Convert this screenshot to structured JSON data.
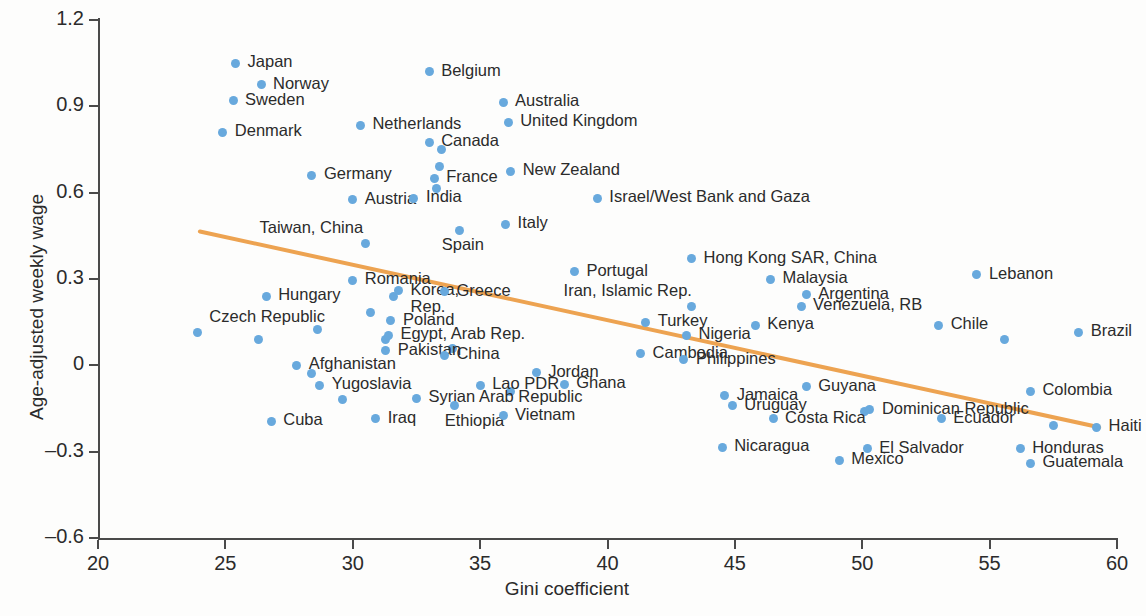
{
  "chart_data": {
    "type": "scatter",
    "title": "",
    "xlabel": "Gini coefficient",
    "ylabel": "Age-adjusted weekly wage",
    "xlim": [
      20,
      60
    ],
    "ylim": [
      -0.6,
      1.2
    ],
    "xticks": [
      "20",
      "25",
      "30",
      "35",
      "40",
      "45",
      "50",
      "55",
      "60"
    ],
    "yticks": [
      "1.2",
      "0.9",
      "0.6",
      "0.3",
      "0",
      "–0.3",
      "–0.6"
    ],
    "grid": false,
    "legend": "none",
    "marker_color": "#68a9dd",
    "trendline_color": "#eda351",
    "trendline": {
      "x1": 24.0,
      "y1": 0.465,
      "x2": 59.3,
      "y2": -0.215
    },
    "points": [
      {
        "label": "Japan",
        "x": 25.4,
        "y": 1.05,
        "lx": 12,
        "ly": -10
      },
      {
        "label": "Norway",
        "x": 26.4,
        "y": 0.975,
        "lx": 12,
        "ly": -10
      },
      {
        "label": "Sweden",
        "x": 25.3,
        "y": 0.92,
        "lx": 12,
        "ly": -10
      },
      {
        "label": "Denmark",
        "x": 24.9,
        "y": 0.81,
        "lx": 12,
        "ly": -10
      },
      {
        "label": "Belgium",
        "x": 33.0,
        "y": 1.02,
        "lx": 12,
        "ly": -10
      },
      {
        "label": "Australia",
        "x": 35.9,
        "y": 0.915,
        "lx": 12,
        "ly": -10
      },
      {
        "label": "United Kingdom",
        "x": 36.1,
        "y": 0.845,
        "lx": 12,
        "ly": -10
      },
      {
        "label": "Netherlands",
        "x": 30.3,
        "y": 0.835,
        "lx": 12,
        "ly": -10
      },
      {
        "label": "Canada",
        "x": 33.0,
        "y": 0.775,
        "lx": 12,
        "ly": -10
      },
      {
        "label": "Germany",
        "x": 28.4,
        "y": 0.66,
        "lx": 12,
        "ly": -10
      },
      {
        "label": "France",
        "x": 33.2,
        "y": 0.65,
        "lx": 12,
        "ly": -10
      },
      {
        "label": "New Zealand",
        "x": 36.2,
        "y": 0.675,
        "lx": 12,
        "ly": -10
      },
      {
        "label": "Austria",
        "x": 30.0,
        "y": 0.575,
        "lx": 12,
        "ly": -10
      },
      {
        "label": "India",
        "x": 32.4,
        "y": 0.58,
        "lx": 12,
        "ly": -10
      },
      {
        "label": "Israel/West Bank and Gaza",
        "x": 39.6,
        "y": 0.58,
        "lx": 12,
        "ly": -10
      },
      {
        "label": "Italy",
        "x": 36.0,
        "y": 0.49,
        "lx": 12,
        "ly": -10
      },
      {
        "label": "Taiwan, China",
        "x": 30.5,
        "y": 0.425,
        "lx": -100,
        "ly": -24
      },
      {
        "label": "Spain",
        "x": 34.2,
        "y": 0.47,
        "lx": -18,
        "ly": 6
      },
      {
        "label": "Hong Kong SAR, China",
        "x": 43.3,
        "y": 0.37,
        "lx": 12,
        "ly": -10
      },
      {
        "label": "Portugal",
        "x": 38.7,
        "y": 0.325,
        "lx": 12,
        "ly": -10
      },
      {
        "label": "Malaysia",
        "x": 46.4,
        "y": 0.3,
        "lx": 12,
        "ly": -10
      },
      {
        "label": "Lebanon",
        "x": 54.5,
        "y": 0.315,
        "lx": 12,
        "ly": -10
      },
      {
        "label": "Romania",
        "x": 30.0,
        "y": 0.295,
        "lx": 12,
        "ly": -10
      },
      {
        "label": "Hungary",
        "x": 26.6,
        "y": 0.24,
        "lx": 12,
        "ly": -10
      },
      {
        "label": "Korea, Rep.",
        "x": 31.8,
        "y": 0.26,
        "lx": 12,
        "ly": -10
      },
      {
        "label": "Greece",
        "x": 33.6,
        "y": 0.255,
        "lx": 12,
        "ly": -10
      },
      {
        "label": "Iran, Islamic Rep.",
        "x": 43.3,
        "y": 0.205,
        "lx": -130,
        "ly": -24
      },
      {
        "label": "Argentina",
        "x": 47.8,
        "y": 0.245,
        "lx": 12,
        "ly": -10
      },
      {
        "label": "Venezuela, RB",
        "x": 47.6,
        "y": 0.205,
        "lx": 12,
        "ly": -10
      },
      {
        "label": "Czech Republic",
        "x": 23.9,
        "y": 0.115,
        "lx": 12,
        "ly": -24
      },
      {
        "label": "Poland",
        "x": 31.5,
        "y": 0.155,
        "lx": 12,
        "ly": -10
      },
      {
        "label": "Turkey",
        "x": 41.5,
        "y": 0.15,
        "lx": 12,
        "ly": -10
      },
      {
        "label": "Kenya",
        "x": 45.8,
        "y": 0.14,
        "lx": 12,
        "ly": -10
      },
      {
        "label": "Chile",
        "x": 53.0,
        "y": 0.14,
        "lx": 12,
        "ly": -10
      },
      {
        "label": "Brazil",
        "x": 58.5,
        "y": 0.115,
        "lx": 12,
        "ly": -10
      },
      {
        "label": "Egypt, Arab Rep.",
        "x": 31.4,
        "y": 0.105,
        "lx": 12,
        "ly": -10
      },
      {
        "label": "Nigeria",
        "x": 43.1,
        "y": 0.105,
        "lx": 12,
        "ly": -10
      },
      {
        "label": "Cambodia",
        "x": 41.3,
        "y": 0.04,
        "lx": 12,
        "ly": -10
      },
      {
        "label": "Pakistan",
        "x": 31.3,
        "y": 0.05,
        "lx": 12,
        "ly": -10
      },
      {
        "label": "China",
        "x": 33.6,
        "y": 0.035,
        "lx": 12,
        "ly": -10
      },
      {
        "label": "Philippines",
        "x": 43.0,
        "y": 0.02,
        "lx": 12,
        "ly": -10
      },
      {
        "label": "Afghanistan",
        "x": 27.8,
        "y": 0.0,
        "lx": 12,
        "ly": -10
      },
      {
        "label": "Jordan",
        "x": 37.2,
        "y": -0.025,
        "lx": 12,
        "ly": -10
      },
      {
        "label": "Ghana",
        "x": 38.3,
        "y": -0.065,
        "lx": 12,
        "ly": -10
      },
      {
        "label": "Guyana",
        "x": 47.8,
        "y": -0.075,
        "lx": 12,
        "ly": -10
      },
      {
        "label": "Yugoslavia",
        "x": 28.7,
        "y": -0.07,
        "lx": 12,
        "ly": -10
      },
      {
        "label": "Lao PDR",
        "x": 35.0,
        "y": -0.07,
        "lx": 12,
        "ly": -10
      },
      {
        "label": "Colombia",
        "x": 56.6,
        "y": -0.09,
        "lx": 12,
        "ly": -10
      },
      {
        "label": "Syrian Arab Republic",
        "x": 32.5,
        "y": -0.115,
        "lx": 12,
        "ly": -10
      },
      {
        "label": "Jamaica",
        "x": 44.6,
        "y": -0.105,
        "lx": 12,
        "ly": -10
      },
      {
        "label": "Uruguay",
        "x": 44.9,
        "y": -0.14,
        "lx": 12,
        "ly": -10
      },
      {
        "label": "Dominican Republic",
        "x": 50.3,
        "y": -0.155,
        "lx": 12,
        "ly": -10
      },
      {
        "label": "Ethiopia",
        "x": 34.0,
        "y": -0.14,
        "lx": -10,
        "ly": 6
      },
      {
        "label": "Vietnam",
        "x": 35.9,
        "y": -0.175,
        "lx": 12,
        "ly": -10
      },
      {
        "label": "Iraq",
        "x": 30.9,
        "y": -0.185,
        "lx": 12,
        "ly": -10
      },
      {
        "label": "Cuba",
        "x": 26.8,
        "y": -0.195,
        "lx": 12,
        "ly": -10
      },
      {
        "label": "Costa Rica",
        "x": 46.5,
        "y": -0.185,
        "lx": 12,
        "ly": -10
      },
      {
        "label": "Ecuador",
        "x": 53.1,
        "y": -0.185,
        "lx": 12,
        "ly": -10
      },
      {
        "label": "Haiti",
        "x": 59.2,
        "y": -0.215,
        "lx": 12,
        "ly": -10
      },
      {
        "label": "Nicaragua",
        "x": 44.5,
        "y": -0.285,
        "lx": 12,
        "ly": -10
      },
      {
        "label": "El Salvador",
        "x": 50.2,
        "y": -0.29,
        "lx": 12,
        "ly": -10
      },
      {
        "label": "Honduras",
        "x": 56.2,
        "y": -0.29,
        "lx": 12,
        "ly": -10
      },
      {
        "label": "Mexico",
        "x": 49.1,
        "y": -0.33,
        "lx": 12,
        "ly": -10
      },
      {
        "label": "Guatemala",
        "x": 56.6,
        "y": -0.34,
        "lx": 12,
        "ly": -10
      }
    ],
    "unlabeled_points": [
      {
        "x": 33.5,
        "y": 0.75
      },
      {
        "x": 33.4,
        "y": 0.69
      },
      {
        "x": 33.3,
        "y": 0.615
      },
      {
        "x": 31.6,
        "y": 0.24
      },
      {
        "x": 30.7,
        "y": 0.185
      },
      {
        "x": 26.3,
        "y": 0.09
      },
      {
        "x": 28.6,
        "y": 0.125
      },
      {
        "x": 31.3,
        "y": 0.09
      },
      {
        "x": 33.9,
        "y": 0.06
      },
      {
        "x": 28.4,
        "y": -0.03
      },
      {
        "x": 29.6,
        "y": -0.12
      },
      {
        "x": 36.2,
        "y": -0.09
      },
      {
        "x": 50.1,
        "y": -0.16
      },
      {
        "x": 57.5,
        "y": -0.21
      },
      {
        "x": 55.6,
        "y": 0.09
      }
    ]
  }
}
